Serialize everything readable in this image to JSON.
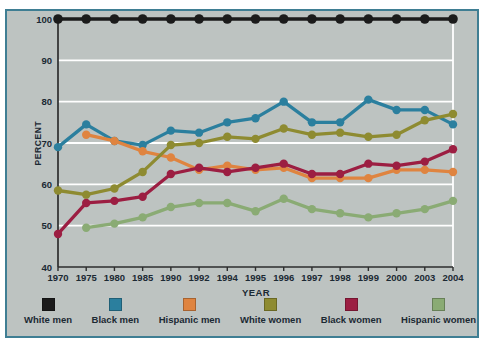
{
  "colors": {
    "panel_bg": "#bdc3c1",
    "panel_border": "#3f7e93",
    "text": "#1b2933",
    "axis": "#2d2d2d",
    "grid": "#ffffff"
  },
  "chart_data": {
    "type": "line",
    "title": "",
    "xlabel": "YEAR",
    "ylabel": "PERCENT",
    "ylim": [
      40,
      100
    ],
    "yticks": [
      100,
      90,
      80,
      70,
      60,
      50,
      40
    ],
    "grid": "horizontal",
    "legend_position": "bottom",
    "categories": [
      "1970",
      "1975",
      "1980",
      "1985",
      "1990",
      "1992",
      "1994",
      "1995",
      "1996",
      "1997",
      "1998",
      "1999",
      "2000",
      "2003",
      "2004"
    ],
    "series": [
      {
        "name": "White men",
        "color": "#1b1b1b",
        "values": [
          100,
          100,
          100,
          100,
          100,
          100,
          100,
          100,
          100,
          100,
          100,
          100,
          100,
          100,
          100
        ]
      },
      {
        "name": "Black men",
        "color": "#2b7f9e",
        "values": [
          69,
          74.5,
          70.5,
          69.5,
          73,
          72.5,
          75,
          76,
          80,
          75,
          75,
          80.5,
          78,
          78,
          74.5
        ]
      },
      {
        "name": "Hispanic men",
        "color": "#df8440",
        "values": [
          null,
          72,
          70.5,
          68,
          66.5,
          63.5,
          64.5,
          63.5,
          64,
          61.5,
          61.5,
          61.5,
          63.5,
          63.5,
          63
        ]
      },
      {
        "name": "White women",
        "color": "#8e8b31",
        "values": [
          58.5,
          57.5,
          59,
          63,
          69.5,
          70,
          71.5,
          71,
          73.5,
          72,
          72.5,
          71.5,
          72,
          75.5,
          77
        ]
      },
      {
        "name": "Black women",
        "color": "#9c1e42",
        "values": [
          48,
          55.5,
          56,
          57,
          62.5,
          64,
          63,
          64,
          65,
          62.5,
          62.5,
          65,
          64.5,
          65.5,
          68.5
        ]
      },
      {
        "name": "Hispanic women",
        "color": "#8aab74",
        "values": [
          null,
          49.5,
          50.5,
          52,
          54.5,
          55.5,
          55.5,
          53.5,
          56.5,
          54,
          53,
          52,
          53,
          54,
          56
        ]
      }
    ]
  }
}
